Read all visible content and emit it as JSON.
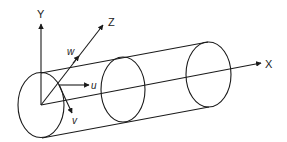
{
  "diagram": {
    "type": "cylinder-coordinate-system",
    "stroke_color": "#1a1a1a",
    "axes": {
      "x": {
        "label": "X"
      },
      "y": {
        "label": "Y"
      },
      "z": {
        "label": "Z"
      }
    },
    "velocity_components": {
      "u": {
        "label": "u"
      },
      "v": {
        "label": "v"
      },
      "w": {
        "label": "w"
      }
    },
    "cross_sections": 3
  }
}
